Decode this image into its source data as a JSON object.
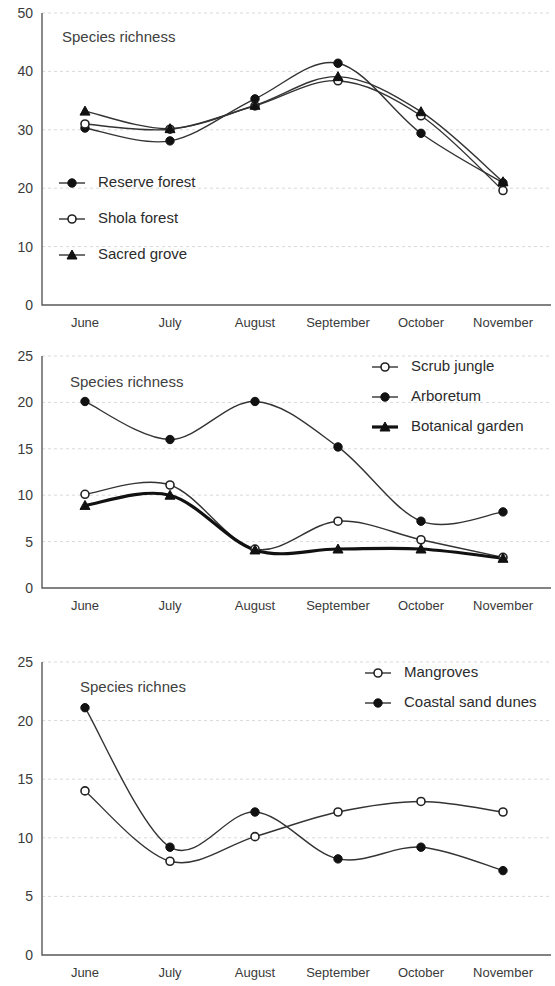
{
  "charts": [
    {
      "id": "chart1",
      "title": "Species richness",
      "ylim": [
        0,
        50
      ],
      "yticks": [
        "0",
        "10",
        "20",
        "30",
        "40",
        "50"
      ],
      "categories": [
        "June",
        "July",
        "August",
        "September",
        "October",
        "November"
      ],
      "legend": [
        {
          "label": "Reserve forest",
          "marker": "filled-circle",
          "weight": "normal"
        },
        {
          "label": "Shola forest",
          "marker": "open-circle",
          "weight": "normal"
        },
        {
          "label": "Sacred grove",
          "marker": "triangle",
          "weight": "normal"
        }
      ]
    },
    {
      "id": "chart2",
      "title": "Species richness",
      "ylim": [
        0,
        25
      ],
      "yticks": [
        "0",
        "5",
        "10",
        "15",
        "20",
        "25"
      ],
      "categories": [
        "June",
        "July",
        "August",
        "September",
        "October",
        "November"
      ],
      "legend": [
        {
          "label": "Scrub jungle",
          "marker": "open-circle",
          "weight": "normal"
        },
        {
          "label": "Arboretum",
          "marker": "filled-circle",
          "weight": "normal"
        },
        {
          "label": "Botanical garden",
          "marker": "triangle",
          "weight": "bold"
        }
      ]
    },
    {
      "id": "chart3",
      "title": "Species richnes",
      "ylim": [
        0,
        25
      ],
      "yticks": [
        "0",
        "5",
        "10",
        "15",
        "20",
        "25"
      ],
      "categories": [
        "June",
        "July",
        "August",
        "September",
        "October",
        "November"
      ],
      "legend": [
        {
          "label": "Mangroves",
          "marker": "open-circle",
          "weight": "normal"
        },
        {
          "label": "Coastal sand dunes",
          "marker": "filled-circle",
          "weight": "normal"
        }
      ]
    }
  ],
  "chart_data": [
    {
      "type": "line",
      "title": "Species richness",
      "xlabel": "",
      "ylabel": "Species richness",
      "ylim": [
        0,
        50
      ],
      "yticks": [
        0,
        10,
        20,
        30,
        40,
        50
      ],
      "grid": true,
      "legend_position": "inside-left",
      "categories": [
        "June",
        "July",
        "August",
        "September",
        "October",
        "November"
      ],
      "series": [
        {
          "name": "Reserve forest",
          "marker": "filled-circle",
          "values": [
            30.3,
            28.1,
            35.3,
            41.4,
            29.4,
            20.9
          ]
        },
        {
          "name": "Shola forest",
          "marker": "open-circle",
          "values": [
            31.0,
            30.1,
            34.1,
            38.4,
            32.4,
            19.6
          ]
        },
        {
          "name": "Sacred grove",
          "marker": "triangle",
          "values": [
            33.2,
            30.2,
            34.2,
            39.1,
            33.1,
            21.1
          ]
        }
      ]
    },
    {
      "type": "line",
      "title": "Species richness",
      "xlabel": "",
      "ylabel": "Species richness",
      "ylim": [
        0,
        25
      ],
      "yticks": [
        0,
        5,
        10,
        15,
        20,
        25
      ],
      "grid": true,
      "legend_position": "top-right",
      "categories": [
        "June",
        "July",
        "August",
        "September",
        "October",
        "November"
      ],
      "series": [
        {
          "name": "Scrub jungle",
          "marker": "open-circle",
          "values": [
            10.1,
            11.1,
            4.2,
            7.2,
            5.2,
            3.3
          ]
        },
        {
          "name": "Arboretum",
          "marker": "filled-circle",
          "values": [
            20.1,
            16.0,
            20.1,
            15.2,
            7.2,
            8.2
          ]
        },
        {
          "name": "Botanical garden",
          "marker": "triangle",
          "values": [
            8.9,
            10.0,
            4.1,
            4.2,
            4.2,
            3.2
          ]
        }
      ]
    },
    {
      "type": "line",
      "title": "Species richnes",
      "xlabel": "",
      "ylabel": "Species richness",
      "ylim": [
        0,
        25
      ],
      "yticks": [
        0,
        5,
        10,
        15,
        20,
        25
      ],
      "grid": true,
      "legend_position": "top-right",
      "categories": [
        "June",
        "July",
        "August",
        "September",
        "October",
        "November"
      ],
      "series": [
        {
          "name": "Mangroves",
          "marker": "open-circle",
          "values": [
            14.0,
            8.0,
            10.1,
            12.2,
            13.1,
            12.2
          ]
        },
        {
          "name": "Coastal sand dunes",
          "marker": "filled-circle",
          "values": [
            21.1,
            9.2,
            12.2,
            8.2,
            9.2,
            7.2
          ]
        }
      ]
    }
  ]
}
